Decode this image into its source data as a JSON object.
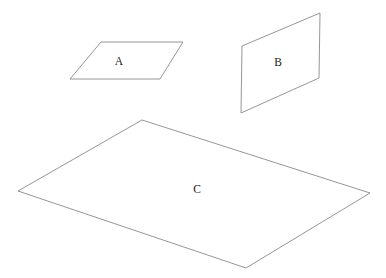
{
  "figure": {
    "background_color": "#ffffff",
    "stroke_color": "#8a8a8a",
    "label_color": "#1a1a1a",
    "width": 386,
    "height": 278,
    "planes": [
      {
        "id": "plane-a",
        "label": "A",
        "orientation": "horizontal-tilted-small",
        "points": "101,42 183,42 160,79 70,79",
        "label_x": 119,
        "label_y": 62
      },
      {
        "id": "plane-b",
        "label": "B",
        "orientation": "vertical-tilted",
        "points": "320,13 319,78 241,113 242,46",
        "label_x": 278,
        "label_y": 63
      },
      {
        "id": "plane-c",
        "label": "C",
        "orientation": "horizontal-large",
        "points": "142,120 370,193 246,268 18,191",
        "label_x": 197,
        "label_y": 190
      }
    ]
  }
}
